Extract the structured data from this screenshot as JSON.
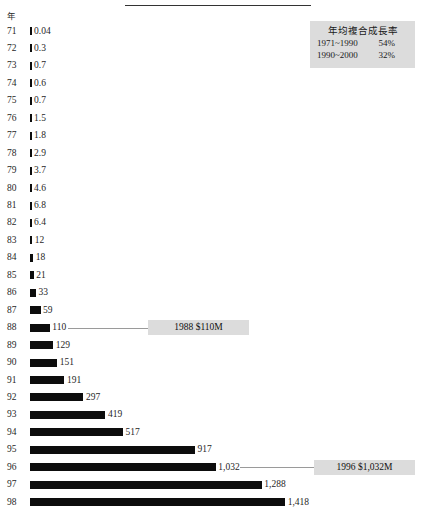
{
  "axis_caption": "年",
  "legend": {
    "title": "年均複合成長率",
    "rows": [
      {
        "period": "1971~1990",
        "value": "54%"
      },
      {
        "period": "1990~2000",
        "value": "32%"
      }
    ]
  },
  "callouts": [
    {
      "name": "callout-1988",
      "label": "1988 $110M",
      "year": "88"
    },
    {
      "name": "callout-1996",
      "label": "1996 $1,032M",
      "year": "96"
    }
  ],
  "chart_data": {
    "type": "bar",
    "orientation": "horizontal",
    "title": "",
    "subtitle": "",
    "xlabel": "",
    "ylabel": "年",
    "grid": false,
    "legend_position": "top-right",
    "xlim": [
      0,
      1418
    ],
    "categories": [
      "71",
      "72",
      "73",
      "74",
      "75",
      "76",
      "77",
      "78",
      "79",
      "80",
      "81",
      "82",
      "83",
      "84",
      "85",
      "86",
      "87",
      "88",
      "89",
      "90",
      "91",
      "92",
      "93",
      "94",
      "95",
      "96",
      "97",
      "98"
    ],
    "value_labels": [
      "0.04",
      "0.3",
      "0.7",
      "0.6",
      "0.7",
      "1.5",
      "1.8",
      "2.9",
      "3.7",
      "4.6",
      "6.8",
      "6.4",
      "12",
      "18",
      "21",
      "33",
      "59",
      "110",
      "129",
      "151",
      "191",
      "297",
      "419",
      "517",
      "917",
      "1,032",
      "1,288",
      "1,418"
    ],
    "values": [
      0.04,
      0.3,
      0.7,
      0.6,
      0.7,
      1.5,
      1.8,
      2.9,
      3.7,
      4.6,
      6.8,
      6.4,
      12,
      18,
      21,
      33,
      59,
      110,
      129,
      151,
      191,
      297,
      419,
      517,
      917,
      1032,
      1288,
      1418
    ],
    "annotations": [
      {
        "category": "88",
        "text": "1988 $110M"
      },
      {
        "category": "96",
        "text": "1996 $1,032M"
      }
    ],
    "legend_entries": [
      {
        "label": "1971~1990",
        "value": "54%"
      },
      {
        "label": "1990~2000",
        "value": "32%"
      }
    ]
  }
}
